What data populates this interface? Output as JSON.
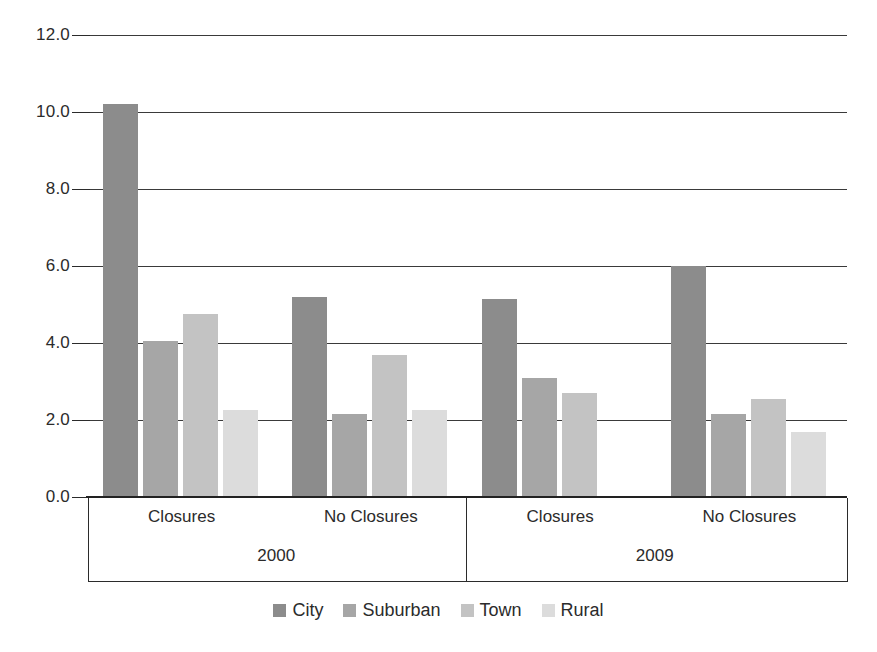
{
  "chart_data": {
    "type": "bar",
    "title": "",
    "subtitle": "",
    "xlabel": "",
    "ylabel": "",
    "ylim": [
      0.0,
      12.0
    ],
    "ytick_labels": [
      "12.0",
      "10.0",
      "8.0",
      "6.0",
      "4.0",
      "2.0",
      "0.0"
    ],
    "ytick_values": [
      12.0,
      10.0,
      8.0,
      6.0,
      4.0,
      2.0,
      0.0
    ],
    "grid": true,
    "legend_position": "bottom",
    "categories": [
      "Closures",
      "No Closures",
      "Closures",
      "No Closures"
    ],
    "group_labels": [
      "2000",
      "2009"
    ],
    "group_spans": [
      2,
      2
    ],
    "series": [
      {
        "name": "City",
        "color": "#8c8c8c",
        "values": [
          10.2,
          5.2,
          5.15,
          6.0
        ]
      },
      {
        "name": "Suburban",
        "color": "#a6a6a6",
        "values": [
          4.05,
          2.15,
          3.1,
          2.15
        ]
      },
      {
        "name": "Town",
        "color": "#c3c3c3",
        "values": [
          4.75,
          3.7,
          2.7,
          2.55
        ]
      },
      {
        "name": "Rural",
        "color": "#dcdcdc",
        "values": [
          2.25,
          2.25,
          0.0,
          1.7
        ]
      }
    ],
    "annotations": []
  },
  "legend": {
    "items": [
      {
        "label": "City",
        "color": "#8c8c8c"
      },
      {
        "label": "Suburban",
        "color": "#a6a6a6"
      },
      {
        "label": "Town",
        "color": "#c3c3c3"
      },
      {
        "label": "Rural",
        "color": "#dcdcdc"
      }
    ]
  },
  "axis": {
    "y_labels": [
      "12.0",
      "10.0",
      "8.0",
      "6.0",
      "4.0",
      "2.0",
      "0.0"
    ],
    "x_sub_labels": [
      "Closures",
      "No Closures",
      "Closures",
      "No Closures"
    ],
    "x_group_labels": [
      "2000",
      "2009"
    ]
  },
  "colors": {
    "grid": "#3a3a3a",
    "axis": "#2b2b2b",
    "background": "#ffffff",
    "text": "#2b2b2b"
  }
}
